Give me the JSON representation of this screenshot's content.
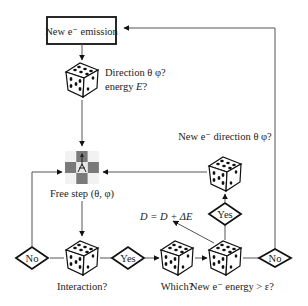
{
  "diagram": {
    "nodes": {
      "emission_box": {
        "label": "New e⁻ emission"
      },
      "dice_direction_energy": {
        "label_line1": "Direction θ φ?",
        "label_line2_prefix": "energy ",
        "label_line2_var": "E",
        "label_line2_suffix": "?"
      },
      "free_step": {
        "label": "Free step (θ, φ)"
      },
      "dice_interaction": {
        "label": "Interaction?"
      },
      "dice_which": {
        "label": "Which?"
      },
      "dice_energy_check": {
        "label": "New e⁻ energy > ε?"
      },
      "dice_new_direction": {
        "label": "New e⁻ direction θ φ?"
      },
      "dose_update": {
        "label": "D = D + ΔE"
      }
    },
    "decisions": {
      "interaction_no": {
        "label": "No"
      },
      "interaction_yes": {
        "label": "Yes"
      },
      "energy_yes": {
        "label": "Yes"
      },
      "energy_no": {
        "label": "No"
      }
    },
    "icons": {
      "dice": "dice-icon",
      "free_step": "random-walk-grid-icon"
    },
    "colors": {
      "line": "#555555",
      "stroke": "#111111",
      "grid_dark": "#7a7a7a",
      "grid_light": "#f2f2f2"
    }
  }
}
